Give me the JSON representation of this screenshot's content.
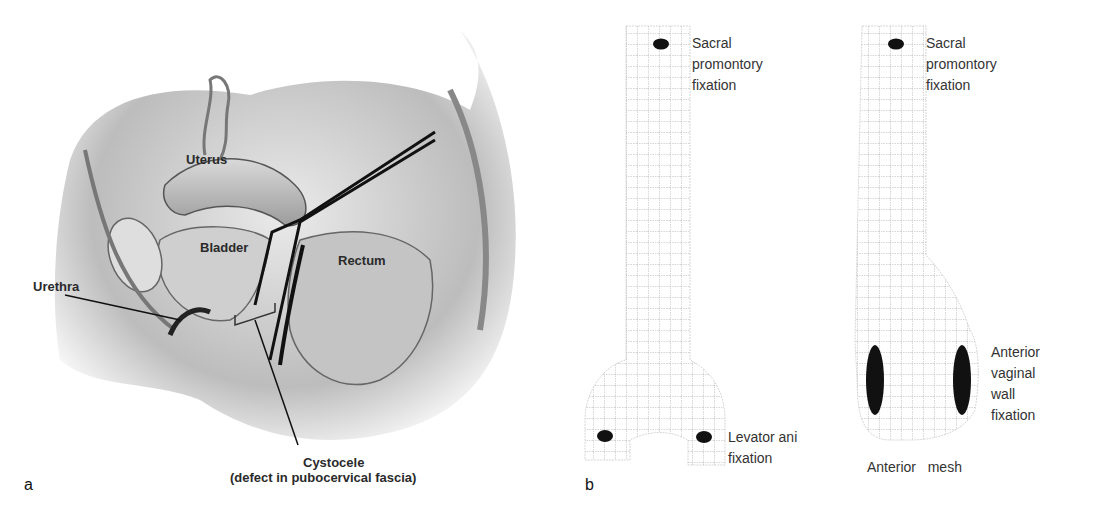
{
  "panel_a": {
    "letter": "a",
    "labels": {
      "uterus": "Uterus",
      "bladder": "Bladder",
      "rectum": "Rectum",
      "urethra": "Urethra",
      "cystocele_line1": "Cystocele",
      "cystocele_line2": "(defect in pubocervical fascia)"
    }
  },
  "panel_b": {
    "letter": "b",
    "left_mesh": {
      "top_label": [
        "Sacral",
        "promontory",
        "fixation"
      ],
      "bottom_label": [
        "Levator ani",
        "fixation"
      ]
    },
    "right_mesh": {
      "top_label": [
        "Sacral",
        "promontory",
        "fixation"
      ],
      "side_label": [
        "Anterior",
        "vaginal",
        "wall",
        "fixation"
      ],
      "caption": "Anterior   mesh"
    }
  }
}
